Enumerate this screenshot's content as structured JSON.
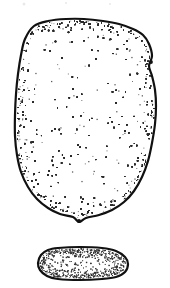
{
  "figure": {
    "title": "Specimen line drawing",
    "caption": "",
    "background_color": "#ffffff",
    "ink_color": "#111111",
    "stipple_color": "#2b2b2b",
    "width": 170,
    "height": 288,
    "style": "stippled ink contour drawing",
    "specimen_count": 2
  },
  "chart_data": {
    "type": "diagram",
    "title": "Specimen line drawing",
    "xlabel": "",
    "ylabel": "",
    "grid": false,
    "legend": null,
    "shapes": [
      {
        "name": "upper-specimen",
        "label": "large rounded-rectangular specimen",
        "bbox": [
          15,
          19,
          156,
          219
        ],
        "width_px": 141,
        "height_px": 200,
        "fill": "#ffffff",
        "stroke": "#111111",
        "stroke_width": 2.2,
        "stipple": true,
        "stipple_density_edge": "high",
        "stipple_density_center": "low",
        "outline_points": [
          [
            34,
            26
          ],
          [
            48,
            21
          ],
          [
            66,
            19
          ],
          [
            84,
            19
          ],
          [
            103,
            21
          ],
          [
            119,
            24
          ],
          [
            133,
            29
          ],
          [
            143,
            35
          ],
          [
            149,
            44
          ],
          [
            152,
            56
          ],
          [
            149,
            66
          ],
          [
            152,
            76
          ],
          [
            155,
            90
          ],
          [
            156,
            106
          ],
          [
            155,
            124
          ],
          [
            152,
            143
          ],
          [
            148,
            161
          ],
          [
            142,
            177
          ],
          [
            134,
            191
          ],
          [
            124,
            202
          ],
          [
            112,
            210
          ],
          [
            99,
            215
          ],
          [
            86,
            218
          ],
          [
            79,
            222
          ],
          [
            73,
            217
          ],
          [
            60,
            214
          ],
          [
            48,
            208
          ],
          [
            37,
            199
          ],
          [
            28,
            187
          ],
          [
            21,
            172
          ],
          [
            17,
            155
          ],
          [
            15,
            136
          ],
          [
            15,
            115
          ],
          [
            16,
            94
          ],
          [
            18,
            74
          ],
          [
            21,
            55
          ],
          [
            25,
            39
          ]
        ],
        "features": [
          {
            "name": "bottom-nub",
            "position": [
              79,
              221
            ]
          },
          {
            "name": "right-shoulder-kink",
            "position": [
              151,
              62
            ]
          }
        ]
      },
      {
        "name": "lower-specimen",
        "label": "small lozenge specimen",
        "bbox": [
          38,
          247,
          129,
          280
        ],
        "width_px": 91,
        "height_px": 33,
        "fill": "#ffffff",
        "stroke": "#111111",
        "stroke_width": 2.2,
        "stipple": true,
        "stipple_density_edge": "high",
        "stipple_density_center": "low",
        "outline_points": [
          [
            58,
            248
          ],
          [
            80,
            247
          ],
          [
            102,
            248
          ],
          [
            116,
            251
          ],
          [
            125,
            257
          ],
          [
            128,
            264
          ],
          [
            125,
            272
          ],
          [
            116,
            277
          ],
          [
            102,
            279
          ],
          [
            80,
            280
          ],
          [
            58,
            279
          ],
          [
            47,
            276
          ],
          [
            40,
            270
          ],
          [
            38,
            263
          ],
          [
            41,
            255
          ],
          [
            48,
            250
          ]
        ],
        "features": []
      }
    ],
    "artifacts": [
      {
        "name": "scan-speck",
        "position": [
          24,
          4
        ],
        "size": 3
      },
      {
        "name": "scan-speck",
        "position": [
          66,
          3
        ],
        "size": 2
      },
      {
        "name": "scan-speck",
        "position": [
          110,
          4
        ],
        "size": 2
      }
    ]
  }
}
